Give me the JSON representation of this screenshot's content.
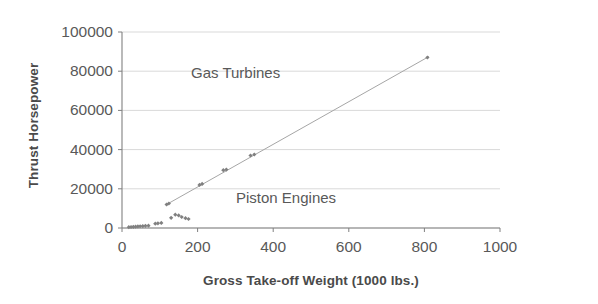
{
  "chart_data": {
    "type": "scatter",
    "title": "",
    "subtitle": "",
    "xlabel": "Gross Take-off Weight (1000 lbs.)",
    "ylabel": "Thrust Horsepower",
    "xlim": [
      0,
      1000
    ],
    "ylim": [
      0,
      100000
    ],
    "xticks": [
      0,
      200,
      400,
      600,
      800,
      1000
    ],
    "yticks": [
      0,
      20000,
      40000,
      60000,
      80000,
      100000
    ],
    "xtick_labels": [
      "0",
      "200",
      "400",
      "600",
      "800",
      "1000"
    ],
    "ytick_labels": [
      "0",
      "20000",
      "40000",
      "60000",
      "80000",
      "100000"
    ],
    "grid": "horizontal",
    "legend": "none",
    "marker_color": "#808080",
    "line_color": "#a6a6a6",
    "axis_color": "#808080",
    "grid_color": "#d9d9d9",
    "series": [
      {
        "name": "Aircraft",
        "marker": "diamond",
        "points": [
          [
            18,
            400
          ],
          [
            24,
            500
          ],
          [
            30,
            600
          ],
          [
            36,
            700
          ],
          [
            42,
            800
          ],
          [
            48,
            900
          ],
          [
            55,
            1000
          ],
          [
            62,
            1100
          ],
          [
            70,
            1200
          ],
          [
            88,
            2200
          ],
          [
            95,
            2400
          ],
          [
            104,
            2600
          ],
          [
            118,
            12000
          ],
          [
            124,
            12500
          ],
          [
            130,
            5200
          ],
          [
            141,
            6800
          ],
          [
            150,
            6400
          ],
          [
            158,
            5600
          ],
          [
            168,
            5000
          ],
          [
            176,
            4600
          ],
          [
            205,
            22000
          ],
          [
            212,
            22500
          ],
          [
            268,
            29500
          ],
          [
            276,
            29800
          ],
          [
            340,
            37000
          ],
          [
            350,
            37500
          ],
          [
            808,
            87000
          ]
        ]
      }
    ],
    "trendline": {
      "name": "Linear fit",
      "x_start": 118,
      "y_start": 12000,
      "x_end": 812,
      "y_end": 87500
    },
    "annotations": [
      {
        "text": "Gas Turbines",
        "x": 250,
        "y": 72000
      },
      {
        "text": "Piston Engines",
        "x": 370,
        "y": 16000
      }
    ]
  },
  "axes": {
    "y_title": "Thrust Horsepower",
    "x_title": "Gross Take-off Weight (1000 lbs.)",
    "y_labels": [
      "100000",
      "80000",
      "60000",
      "40000",
      "20000",
      "0"
    ],
    "x_labels": [
      "0",
      "200",
      "400",
      "600",
      "800",
      "1000"
    ]
  },
  "annotations": {
    "gas_turbines": "Gas Turbines",
    "piston_engines": "Piston Engines"
  }
}
